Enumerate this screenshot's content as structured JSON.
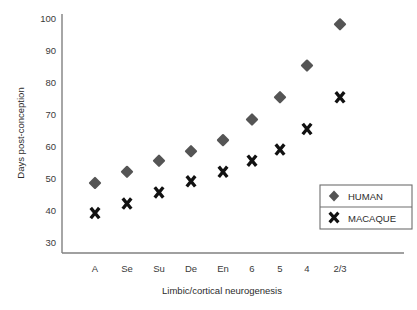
{
  "chart_data": {
    "type": "scatter",
    "title": "",
    "xlabel": "Limbic/cortical neurogenesis",
    "ylabel": "Days post-conception",
    "categories": [
      "A",
      "Se",
      "Su",
      "De",
      "En",
      "6",
      "5",
      "4",
      "2/3"
    ],
    "yticks": [
      30,
      40,
      50,
      60,
      70,
      80,
      90,
      100
    ],
    "ylim": [
      28,
      102
    ],
    "grid": false,
    "legend_position": "right-inside",
    "series": [
      {
        "name": "HUMAN",
        "marker": "diamond",
        "color": "#555555",
        "values": [
          48,
          51.5,
          55,
          58,
          61.5,
          68,
          75,
          85,
          98
        ]
      },
      {
        "name": "MACAQUE",
        "marker": "x",
        "color": "#111111",
        "values": [
          38.5,
          41.5,
          45,
          48.5,
          51.5,
          55,
          58.5,
          65,
          75
        ]
      }
    ]
  },
  "axes": {
    "y_tick_labels": [
      "100",
      "90",
      "80",
      "70",
      "60",
      "50",
      "40",
      "30"
    ],
    "x_tick_labels": [
      "A",
      "Se",
      "Su",
      "De",
      "En",
      "6",
      "5",
      "4",
      "2/3"
    ],
    "y_axis_title": "Days post-conception",
    "x_axis_title": "Limbic/cortical neurogenesis"
  },
  "legend": {
    "entries": [
      {
        "label": "HUMAN",
        "marker": "diamond-marker"
      },
      {
        "label": "MACAQUE",
        "marker": "x-marker"
      }
    ]
  },
  "colors": {
    "human": "#555555",
    "macaque": "#111111",
    "axis": "#808080",
    "text": "#2b2b2b",
    "background": "#ffffff"
  }
}
